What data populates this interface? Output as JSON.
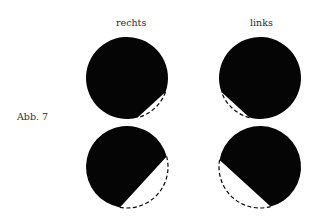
{
  "figure": {
    "caption": "Abb. 7",
    "columns": [
      "rechts",
      "links"
    ],
    "colors": {
      "fill": "#050505",
      "background": "#ffffff"
    },
    "panels": [
      {
        "id": "top-right-eye",
        "column": "rechts",
        "row": 1,
        "cx": 127,
        "cy": 78,
        "r": 41,
        "cut_from_deg": 20,
        "cut_to_deg": 75
      },
      {
        "id": "top-left-eye",
        "column": "links",
        "row": 1,
        "cx": 260,
        "cy": 78,
        "r": 41,
        "cut_from_deg": 105,
        "cut_to_deg": 160
      },
      {
        "id": "bottom-right-eye",
        "column": "rechts",
        "row": 2,
        "cx": 127,
        "cy": 167,
        "r": 41,
        "cut_from_deg": -15,
        "cut_to_deg": 100
      },
      {
        "id": "bottom-left-eye",
        "column": "links",
        "row": 2,
        "cx": 260,
        "cy": 167,
        "r": 41,
        "cut_from_deg": 75,
        "cut_to_deg": 190
      }
    ]
  }
}
